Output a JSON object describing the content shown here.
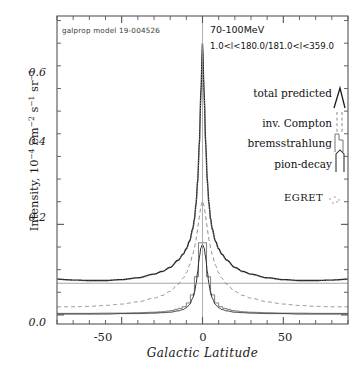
{
  "figure": {
    "model_label": "galprop model 19-004526",
    "energy_band": "70-100MeV",
    "longitude_range": "1.0<l<180.0/181.0<l<359.0",
    "egret_label": "EGRET"
  },
  "legend": {
    "items": [
      {
        "label": "total predicted",
        "style": "solid"
      },
      {
        "label": "inv. Compton",
        "style": "dashed"
      },
      {
        "label": "bremsstrahlung",
        "style": "histogram"
      },
      {
        "label": "pion-decay",
        "style": "dotted"
      }
    ]
  },
  "axis": {
    "y_ticks": [
      "0.0",
      "0.2",
      "0.4",
      "0.6"
    ],
    "x_ticks": [
      "-50",
      "0",
      "50"
    ]
  },
  "chart_data": {
    "type": "line",
    "title": "",
    "xlabel": "Galactic Latitude",
    "ylabel": "Intensity, 10^-4 cm^-2 s^-1 sr^-1",
    "xlim": [
      -90,
      90
    ],
    "ylim": [
      -0.02,
      0.66
    ],
    "grid": false,
    "legend_position": "right",
    "x": [
      -90,
      -80,
      -70,
      -60,
      -50,
      -40,
      -30,
      -25,
      -20,
      -15,
      -12,
      -10,
      -8,
      -6,
      -5,
      -4,
      -3,
      -2,
      -1,
      0,
      1,
      2,
      3,
      4,
      5,
      6,
      8,
      10,
      12,
      15,
      20,
      25,
      30,
      40,
      50,
      60,
      70,
      80,
      90
    ],
    "series": [
      {
        "name": "total predicted",
        "style": "solid",
        "peak": 0.6,
        "values": [
          0.079,
          0.077,
          0.076,
          0.076,
          0.078,
          0.082,
          0.09,
          0.096,
          0.105,
          0.121,
          0.134,
          0.146,
          0.163,
          0.19,
          0.212,
          0.245,
          0.295,
          0.375,
          0.49,
          0.6,
          0.49,
          0.375,
          0.295,
          0.245,
          0.212,
          0.19,
          0.163,
          0.146,
          0.134,
          0.121,
          0.105,
          0.096,
          0.09,
          0.082,
          0.078,
          0.076,
          0.076,
          0.077,
          0.079
        ]
      },
      {
        "name": "inv. Compton",
        "style": "dashed",
        "peak": 0.25,
        "values": [
          0.018,
          0.018,
          0.019,
          0.021,
          0.024,
          0.029,
          0.037,
          0.043,
          0.052,
          0.068,
          0.081,
          0.093,
          0.11,
          0.133,
          0.148,
          0.166,
          0.19,
          0.216,
          0.24,
          0.252,
          0.24,
          0.216,
          0.19,
          0.166,
          0.148,
          0.133,
          0.11,
          0.093,
          0.081,
          0.068,
          0.052,
          0.043,
          0.037,
          0.029,
          0.024,
          0.021,
          0.019,
          0.018,
          0.018
        ]
      },
      {
        "name": "bremsstrahlung",
        "style": "histogram",
        "peak": 0.17,
        "values": [
          0.0035,
          0.0035,
          0.0035,
          0.004,
          0.004,
          0.005,
          0.006,
          0.007,
          0.009,
          0.013,
          0.017,
          0.021,
          0.029,
          0.045,
          0.06,
          0.08,
          0.108,
          0.14,
          0.163,
          0.172,
          0.163,
          0.14,
          0.108,
          0.08,
          0.06,
          0.045,
          0.029,
          0.021,
          0.017,
          0.013,
          0.009,
          0.007,
          0.006,
          0.005,
          0.004,
          0.004,
          0.0035,
          0.0035,
          0.0035
        ]
      },
      {
        "name": "pion-decay",
        "style": "solid-low",
        "peak": 0.155,
        "values": [
          0.002,
          0.002,
          0.002,
          0.002,
          0.003,
          0.003,
          0.004,
          0.005,
          0.006,
          0.009,
          0.012,
          0.016,
          0.023,
          0.037,
          0.05,
          0.068,
          0.095,
          0.126,
          0.148,
          0.156,
          0.148,
          0.126,
          0.095,
          0.068,
          0.05,
          0.037,
          0.023,
          0.016,
          0.012,
          0.009,
          0.006,
          0.005,
          0.004,
          0.003,
          0.003,
          0.002,
          0.002,
          0.002,
          0.002
        ]
      },
      {
        "name": "reference-level",
        "style": "horizontal-line",
        "peak": 0.07,
        "values": [
          0.07,
          0.07,
          0.07,
          0.07,
          0.07,
          0.07,
          0.07,
          0.07,
          0.07,
          0.07,
          0.07,
          0.07,
          0.07,
          0.07,
          0.07,
          0.07,
          0.07,
          0.07,
          0.07,
          0.07,
          0.07,
          0.07,
          0.07,
          0.07,
          0.07,
          0.07,
          0.07,
          0.07,
          0.07,
          0.07,
          0.07,
          0.07,
          0.07,
          0.07,
          0.07,
          0.07,
          0.07,
          0.07,
          0.07
        ]
      }
    ]
  }
}
